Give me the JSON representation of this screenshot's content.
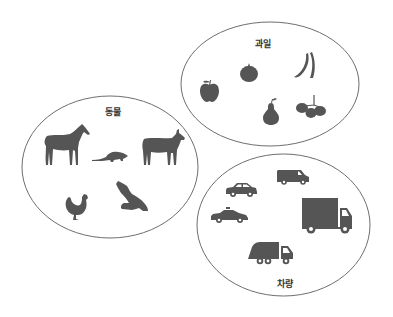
{
  "diagram": {
    "type": "set-grouping",
    "groups": [
      {
        "id": "fruits",
        "label": "과일",
        "items": [
          "apple",
          "tomato",
          "banana",
          "pear",
          "grapes"
        ]
      },
      {
        "id": "animals",
        "label": "동물",
        "items": [
          "horse",
          "rat",
          "goat",
          "rooster",
          "eagle"
        ]
      },
      {
        "id": "vehicles",
        "label": "차량",
        "items": [
          "car",
          "van",
          "taxi",
          "truck",
          "garbage-truck"
        ]
      }
    ]
  },
  "colors": {
    "icon": "#555555",
    "outline": "#6e6e6e",
    "label": "#333333",
    "background": "#ffffff"
  }
}
